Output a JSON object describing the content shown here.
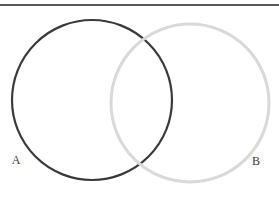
{
  "figure": {
    "name": "two-set-venn-diagram",
    "width": 279,
    "height": 197,
    "background_color": "#ffffff"
  },
  "divider": {
    "name": "top-horizontal-rule",
    "color": "#5a5a5a",
    "y": 5,
    "x_start": 0,
    "x_end": 279,
    "thickness": 1.1
  },
  "chart_data": {
    "type": "diagram",
    "diagram_type": "venn",
    "title": "",
    "sets": [
      {
        "id": "A",
        "label": "A",
        "color": "#3a3a3a",
        "stroke_width": 2.2,
        "fill": "none",
        "center_x": 92,
        "center_y": 100,
        "radius": 80,
        "label_x": 16,
        "label_y": 164,
        "label_position": "bottom-left-outside"
      },
      {
        "id": "B",
        "label": "B",
        "color": "#d9d9d9",
        "stroke_width": 3.0,
        "fill": "none",
        "center_x": 190,
        "center_y": 103,
        "radius": 79,
        "label_x": 256,
        "label_y": 165,
        "label_position": "bottom-right-outside"
      }
    ],
    "intersections": [
      {
        "x": 140,
        "y": 35
      },
      {
        "x": 140,
        "y": 166
      }
    ],
    "region_labels": [],
    "shaded_regions": [],
    "legend": null,
    "grid": false,
    "axis": false
  }
}
